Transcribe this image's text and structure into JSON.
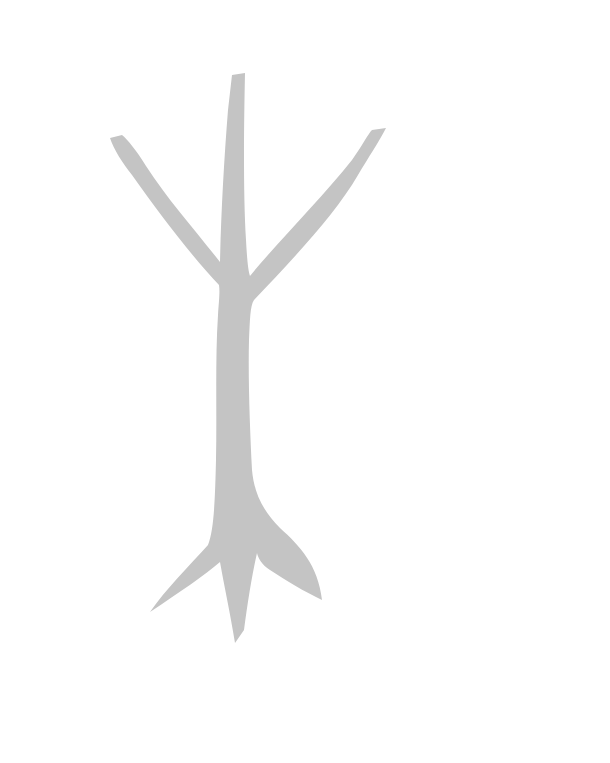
{
  "image": {
    "description": "Gray tree / rune-like silhouette on white background",
    "background_color": "#ffffff",
    "shape_color": "#c4c4c4"
  }
}
